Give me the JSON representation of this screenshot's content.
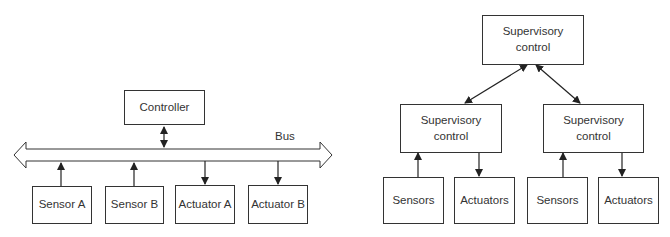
{
  "left_diagram": {
    "controller": "Controller",
    "bus_label": "Bus",
    "devices": [
      {
        "label": "Sensor A",
        "direction": "to-bus"
      },
      {
        "label": "Sensor B",
        "direction": "to-bus"
      },
      {
        "label": "Actuator A",
        "direction": "from-bus"
      },
      {
        "label": "Actuator B",
        "direction": "from-bus"
      }
    ]
  },
  "right_diagram": {
    "top": "Supervisory\ncontrol",
    "middle": [
      {
        "label": "Supervisory\ncontrol",
        "sensors": "Sensors",
        "actuators": "Actuators"
      },
      {
        "label": "Supervisory\ncontrol",
        "sensors": "Sensors",
        "actuators": "Actuators"
      }
    ]
  },
  "colors": {
    "stroke": "#333333",
    "background": "#ffffff"
  }
}
